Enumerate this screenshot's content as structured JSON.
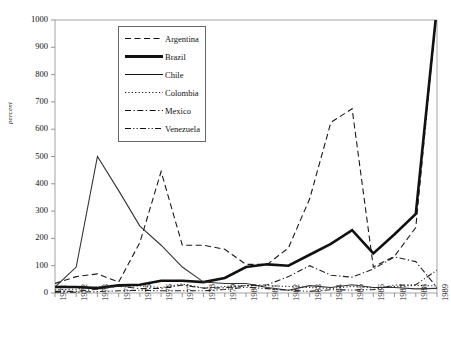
{
  "chart_data": {
    "type": "line",
    "title": "",
    "subtitle": "",
    "xlabel": "",
    "ylabel": "percent",
    "xlim": [
      1971,
      1989
    ],
    "ylim": [
      0,
      1000
    ],
    "grid": false,
    "legend_position": "top-left-inside",
    "x": [
      1971,
      1972,
      1973,
      1974,
      1975,
      1976,
      1977,
      1978,
      1979,
      1980,
      1981,
      1982,
      1983,
      1984,
      1985,
      1986,
      1987,
      1988,
      1989
    ],
    "xtick_labels": [
      "1971",
      "1972",
      "1973",
      "1974",
      "1975",
      "1976",
      "1977",
      "1978",
      "1979",
      "1980",
      "1981",
      "1982",
      "1983",
      "1984",
      "1985",
      "1986",
      "1987",
      "1988",
      "1989"
    ],
    "ytick_labels": [
      "0",
      "100",
      "200",
      "300",
      "400",
      "500",
      "600",
      "700",
      "800",
      "900",
      "1000"
    ],
    "ytick_values": [
      0,
      100,
      200,
      300,
      400,
      500,
      600,
      700,
      800,
      900,
      1000
    ],
    "series": [
      {
        "name": "Argentina",
        "style": "dashed",
        "width": 1.1,
        "color": "#1a1a1a",
        "values": [
          35,
          60,
          70,
          40,
          185,
          445,
          175,
          175,
          160,
          105,
          105,
          165,
          345,
          625,
          675,
          95,
          135,
          240,
          1050
        ]
      },
      {
        "name": "Brazil",
        "style": "solid",
        "width": 2.6,
        "color": "#111111",
        "values": [
          22,
          22,
          18,
          28,
          30,
          45,
          45,
          40,
          55,
          95,
          105,
          100,
          140,
          180,
          230,
          145,
          215,
          290,
          1050
        ]
      },
      {
        "name": "Chile",
        "style": "solid",
        "width": 1.1,
        "color": "#333333",
        "values": [
          22,
          95,
          500,
          375,
          245,
          175,
          95,
          40,
          35,
          35,
          20,
          10,
          27,
          20,
          30,
          20,
          20,
          15,
          17
        ]
      },
      {
        "name": "Colombia",
        "style": "dotted",
        "width": 1.1,
        "color": "#222222",
        "values": [
          12,
          14,
          22,
          25,
          26,
          20,
          33,
          18,
          24,
          27,
          27,
          24,
          20,
          17,
          24,
          19,
          24,
          28,
          26
        ]
      },
      {
        "name": "Mexico",
        "style": "dashdot",
        "width": 1.1,
        "color": "#222222",
        "values": [
          6,
          6,
          14,
          25,
          16,
          17,
          29,
          18,
          19,
          27,
          30,
          60,
          100,
          65,
          58,
          88,
          132,
          115,
          20
        ]
      },
      {
        "name": "Venezuela",
        "style": "dashdotdot",
        "width": 1.1,
        "color": "#222222",
        "values": [
          3,
          3,
          5,
          8,
          10,
          8,
          8,
          8,
          13,
          21,
          16,
          10,
          6,
          12,
          11,
          12,
          29,
          30,
          84
        ]
      }
    ]
  },
  "legend": {
    "items": [
      {
        "label": "Argentina",
        "style": "dashed"
      },
      {
        "label": "Brazil",
        "style": "solid-thick"
      },
      {
        "label": "Chile",
        "style": "solid"
      },
      {
        "label": "Colombia",
        "style": "dotted"
      },
      {
        "label": "Mexico",
        "style": "dashdot"
      },
      {
        "label": "Venezuela",
        "style": "dashdotdot"
      }
    ]
  }
}
